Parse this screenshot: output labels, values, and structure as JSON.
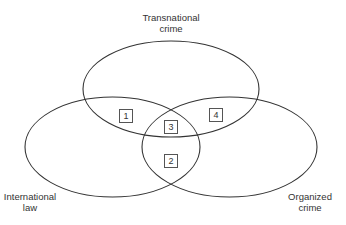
{
  "diagram": {
    "type": "venn",
    "sets": [
      {
        "id": "top",
        "label_line1": "Transnational",
        "label_line2": "crime"
      },
      {
        "id": "left",
        "label_line1": "International",
        "label_line2": "law"
      },
      {
        "id": "right",
        "label_line1": "Organized",
        "label_line2": "crime"
      }
    ],
    "regions": [
      {
        "id": "1",
        "label": "1",
        "intersection": [
          "Transnational crime",
          "International law"
        ]
      },
      {
        "id": "2",
        "label": "2",
        "intersection": [
          "International law",
          "Organized crime"
        ]
      },
      {
        "id": "3",
        "label": "3",
        "intersection": [
          "Transnational crime",
          "International law",
          "Organized crime"
        ]
      },
      {
        "id": "4",
        "label": "4",
        "intersection": [
          "Transnational crime",
          "Organized crime"
        ]
      }
    ]
  }
}
